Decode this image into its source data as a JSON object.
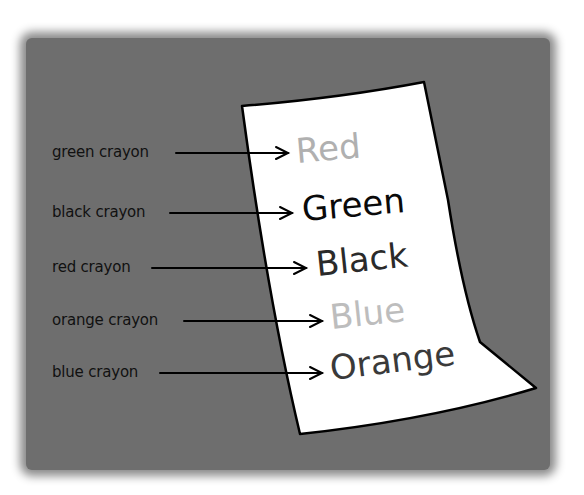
{
  "diagram": {
    "background_color": "#6e6e6e",
    "paper_color": "#ffffff",
    "rows": [
      {
        "label": "green crayon",
        "word": "Red",
        "word_color": "#b0b0b0"
      },
      {
        "label": "black crayon",
        "word": "Green",
        "word_color": "#0a0a0a"
      },
      {
        "label": "red crayon",
        "word": "Black",
        "word_color": "#2a2a2a"
      },
      {
        "label": "orange crayon",
        "word": "Blue",
        "word_color": "#bdbdbd"
      },
      {
        "label": "blue crayon",
        "word": "Orange",
        "word_color": "#3a3a3a"
      }
    ]
  }
}
